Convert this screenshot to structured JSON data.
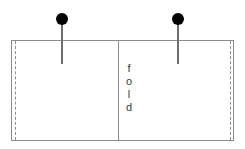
{
  "diagram": {
    "background_color": "#ffffff",
    "outline_color": "#8c8c8c",
    "pin_color": "#000000",
    "pin_shaft_color": "#6e6e6e",
    "text_color": "#3a3a3a",
    "sheet": {
      "seam_left_label": "",
      "seam_right_label": ""
    },
    "fold": {
      "label_characters": [
        "f",
        "o",
        "l",
        "d"
      ],
      "orientation": "vertical"
    },
    "pins": [
      {
        "name": "left-pin",
        "label": ""
      },
      {
        "name": "right-pin",
        "label": ""
      }
    ]
  }
}
